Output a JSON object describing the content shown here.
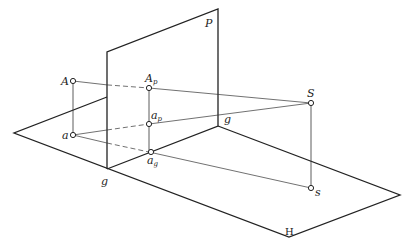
{
  "diagram": {
    "planes": {
      "picture_plane_label": "P",
      "ground_plane_label": "H",
      "ground_line_label_front": "g",
      "ground_line_label_back": "g"
    },
    "points": {
      "A": {
        "main": "A",
        "sub": ""
      },
      "a": {
        "main": "a",
        "sub": ""
      },
      "Ap": {
        "main": "A",
        "sub": "p"
      },
      "ap": {
        "main": "a",
        "sub": "p"
      },
      "ag": {
        "main": "a",
        "sub": "g"
      },
      "S": {
        "main": "S",
        "sub": ""
      },
      "s": {
        "main": "s",
        "sub": ""
      }
    },
    "colors": {
      "line": "#222222",
      "background": "#ffffff"
    }
  }
}
